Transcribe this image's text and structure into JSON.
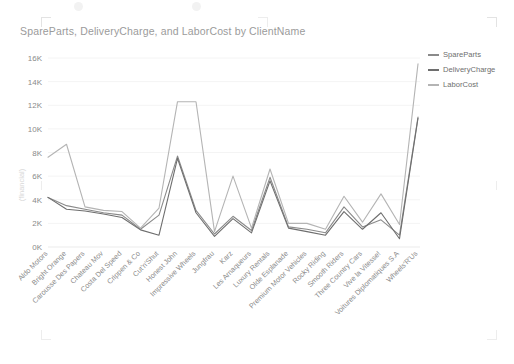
{
  "visual": {
    "title": "SpareParts, DeliveryCharge, and LaborCost by ClientName",
    "y_axis_title": "(financial)"
  },
  "legend": {
    "position": "top-right",
    "items": [
      {
        "label": "SpareParts",
        "color": "#8a8a8a"
      },
      {
        "label": "DeliveryCharge",
        "color": "#6e6e6e"
      },
      {
        "label": "LaborCost",
        "color": "#b4b4b4"
      }
    ]
  },
  "chart_data": {
    "type": "line",
    "title": "SpareParts, DeliveryCharge, and LaborCost by ClientName",
    "xlabel": "ClientName",
    "ylabel": "(financial)",
    "ylim": [
      0,
      16000
    ],
    "ytick_labels": [
      "16K",
      "14K",
      "12K",
      "10K",
      "8K",
      "6K",
      "4K",
      "2K",
      "0K"
    ],
    "ytick_values": [
      16000,
      14000,
      12000,
      10000,
      8000,
      6000,
      4000,
      2000,
      0
    ],
    "grid": true,
    "categories": [
      "Aldo Motors",
      "Bright Orange",
      "Carousse Des Papers",
      "Chateau Mov",
      "Costa Del Speed",
      "Crippen & Co",
      "Cut'n'Shut",
      "Honest John",
      "Impressive Wheels",
      "Jungfrau",
      "Karz",
      "Les Arnaqueurs",
      "Luxury Rentals",
      "Olde Esplanade",
      "Premium Motor Vehicles",
      "Rocky Riding",
      "Smooth Riders",
      "Three Country Cars",
      "Vive la Vitesse!",
      "Voitures Diplomatiques S.A",
      "Wheels'R'Us"
    ],
    "series": [
      {
        "name": "SpareParts",
        "color": "#8a8a8a",
        "values": [
          4200,
          3500,
          3200,
          2900,
          2700,
          1500,
          2700,
          7700,
          3100,
          1100,
          2600,
          1400,
          5900,
          1700,
          1500,
          1200,
          3400,
          1700,
          2300,
          1000,
          11000
        ]
      },
      {
        "name": "DeliveryCharge",
        "color": "#6e6e6e",
        "values": [
          4200,
          3200,
          3050,
          2800,
          2500,
          1450,
          1000,
          7500,
          2900,
          900,
          2400,
          1200,
          5600,
          1600,
          1300,
          1000,
          3000,
          1500,
          2900,
          700,
          10900
        ]
      },
      {
        "name": "LaborCost",
        "color": "#b4b4b4",
        "values": [
          7600,
          8700,
          3400,
          3100,
          3000,
          1600,
          3300,
          12300,
          12300,
          1300,
          6000,
          1600,
          6600,
          2000,
          2000,
          1500,
          4300,
          2100,
          4500,
          1900,
          15500
        ]
      }
    ]
  }
}
